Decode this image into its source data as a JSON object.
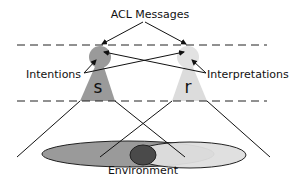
{
  "diagram": {
    "title": "ACL Messages",
    "labels": {
      "intentions": "Intentions",
      "interpretations": "Interpretations",
      "environment": "Environment"
    },
    "agents": [
      {
        "id": "sender",
        "symbol": "s",
        "fill": "#9a9a9a"
      },
      {
        "id": "receiver",
        "symbol": "r",
        "fill": "#dcdcdc"
      }
    ],
    "colors": {
      "sender_fill": "#9a9a9a",
      "receiver_fill": "#dcdcdc",
      "overlap_fill": "#4a4a4a",
      "line": "#111111"
    },
    "edges": [
      {
        "from": "ACL Messages",
        "to": "s"
      },
      {
        "from": "ACL Messages",
        "to": "r"
      },
      {
        "from": "Intentions",
        "to": "s"
      },
      {
        "from": "Intentions",
        "to": "r"
      },
      {
        "from": "Interpretations",
        "to": "s"
      },
      {
        "from": "Interpretations",
        "to": "r"
      }
    ]
  }
}
